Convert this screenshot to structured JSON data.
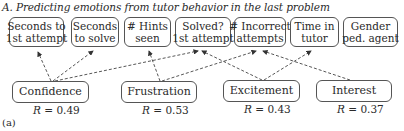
{
  "title": "A. Predicting emotions from tutor behavior in the last problem",
  "panel_label": "(a)",
  "features": [
    {
      "id": "sec_first",
      "line1": "Seconds to",
      "line2": "1st attempt"
    },
    {
      "id": "sec_solve",
      "line1": "Seconds",
      "line2": "to solve"
    },
    {
      "id": "hints",
      "line1": "# Hints",
      "line2": "seen"
    },
    {
      "id": "solved",
      "line1": "Solved?",
      "line2": "1st attempt"
    },
    {
      "id": "incorrect",
      "line1": "# Incorrect",
      "line2": "attempts"
    },
    {
      "id": "time",
      "line1": "Time in",
      "line2": "tutor"
    },
    {
      "id": "gender",
      "line1": "Gender",
      "line2": "ped. agent"
    }
  ],
  "emotions": [
    {
      "id": "confidence",
      "label": "Confidence",
      "r_label": "R",
      "r_value": "= 0.49"
    },
    {
      "id": "frustration",
      "label": "Frustration",
      "r_label": "R",
      "r_value": "= 0.53"
    },
    {
      "id": "excitement",
      "label": "Excitement",
      "r_label": "R",
      "r_value": "= 0.43"
    },
    {
      "id": "interest",
      "label": "Interest",
      "r_label": "R",
      "r_value": "= 0.37"
    }
  ],
  "edges": [
    {
      "from": "confidence",
      "to": "sec_first"
    },
    {
      "from": "confidence",
      "to": "sec_solve"
    },
    {
      "from": "confidence",
      "to": "solved"
    },
    {
      "from": "frustration",
      "to": "hints"
    },
    {
      "from": "frustration",
      "to": "incorrect"
    },
    {
      "from": "excitement",
      "to": "solved"
    },
    {
      "from": "excitement",
      "to": "time"
    },
    {
      "from": "interest",
      "to": "incorrect"
    }
  ],
  "style": {
    "line_color": "#444444",
    "box_border": "#555555"
  }
}
